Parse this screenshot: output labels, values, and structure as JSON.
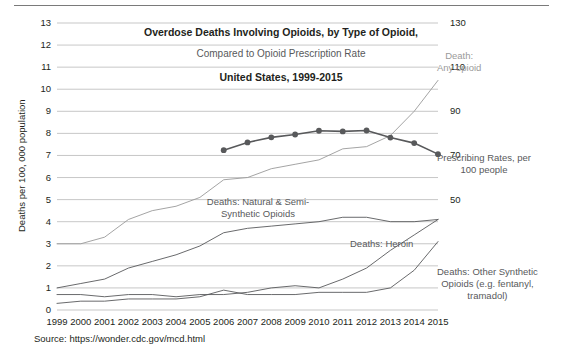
{
  "figure": {
    "source_note": "Source: https://wonder.cdc.gov/mcd.html"
  },
  "chart_data": {
    "type": "line",
    "title": "Overdose Deaths Involving Opioids, by Type of Opioid,",
    "subtitle": "Compared to Opioid Prescription Rate",
    "title_third": "United States, 1999-2015",
    "xlabel": "",
    "ylabel": "Deaths per 100, 000 population",
    "ylabel_right": "Prescriptions per 100 people",
    "grid": true,
    "legend_position": "inline-annotations",
    "x": [
      1999,
      2000,
      2001,
      2002,
      2003,
      2004,
      2005,
      2006,
      2007,
      2008,
      2009,
      2010,
      2011,
      2012,
      2013,
      2014,
      2015
    ],
    "categories": [
      "1999",
      "2000",
      "2001",
      "2002",
      "2003",
      "2004",
      "2005",
      "2006",
      "2007",
      "2008",
      "2009",
      "2010",
      "2011",
      "2012",
      "2013",
      "2014",
      "2015"
    ],
    "ylim": [
      0,
      13
    ],
    "yticks": [
      0,
      1,
      2,
      3,
      4,
      5,
      6,
      7,
      8,
      9,
      10,
      11,
      12,
      13
    ],
    "ytick_labels": [
      "0",
      "1",
      "2",
      "3",
      "4",
      "5",
      "6",
      "7",
      "8",
      "9",
      "10",
      "11",
      "12",
      "13"
    ],
    "ylim_right": [
      0,
      130
    ],
    "yticks_right": [
      50,
      70,
      90,
      110,
      130
    ],
    "ytick_labels_right": [
      "50",
      "70",
      "90",
      "110",
      "130"
    ],
    "series": [
      {
        "name": "Death: Any opioid",
        "label": "Death:\nAny opioid",
        "color": "#9a9a9a",
        "axis": "left",
        "values": [
          3.0,
          3.0,
          3.3,
          4.1,
          4.5,
          4.7,
          5.1,
          5.9,
          6.0,
          6.4,
          6.6,
          6.8,
          7.3,
          7.4,
          7.9,
          9.0,
          10.4
        ]
      },
      {
        "name": "Deaths: Natural & Semi-Synthetic Opioids",
        "label": "Deaths: Natural & Semi-\nSynthetic Opioids",
        "color": "#58595b",
        "axis": "left",
        "values": [
          1.0,
          1.2,
          1.4,
          1.9,
          2.2,
          2.5,
          2.9,
          3.5,
          3.7,
          3.8,
          3.9,
          4.0,
          4.2,
          4.2,
          4.0,
          4.0,
          4.1
        ]
      },
      {
        "name": "Deaths: Heroin",
        "label": "Deaths: Heroin",
        "color": "#58595b",
        "axis": "left",
        "values": [
          0.7,
          0.7,
          0.6,
          0.7,
          0.7,
          0.6,
          0.7,
          0.7,
          0.8,
          1.0,
          1.1,
          1.0,
          1.4,
          1.9,
          2.7,
          3.4,
          4.1
        ]
      },
      {
        "name": "Deaths: Other Synthetic Opioids (e.g. fentanyl, tramadol)",
        "label": "Deaths: Other Synthetic\nOpioids (e.g. fentanyl,\ntramadol)",
        "color": "#58595b",
        "axis": "left",
        "values": [
          0.3,
          0.4,
          0.4,
          0.5,
          0.5,
          0.5,
          0.6,
          0.9,
          0.7,
          0.7,
          0.7,
          0.8,
          0.8,
          0.8,
          1.0,
          1.8,
          3.1
        ]
      },
      {
        "name": "Prescribing Rates, per 100 people",
        "label": "Prescribing Rates, per\n100 people",
        "color": "#58595b",
        "axis": "right",
        "marker": true,
        "start_year": 2006,
        "values_right": [
          null,
          null,
          null,
          null,
          null,
          null,
          null,
          72.4,
          75.9,
          78.2,
          79.5,
          81.2,
          80.9,
          81.3,
          78.1,
          75.6,
          70.6
        ]
      }
    ]
  }
}
